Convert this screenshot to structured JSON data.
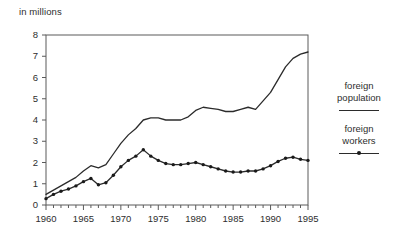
{
  "figure": {
    "unit_label": "in millions"
  },
  "legend": {
    "position": "right",
    "entries": [
      {
        "label": "foreign\npopulation",
        "style": "solid-line",
        "marker": "none"
      },
      {
        "label": "foreign\nworkers",
        "style": "line-with-dot",
        "marker": "dot"
      }
    ]
  },
  "chart_data": {
    "type": "line",
    "title": "",
    "subtitle": "",
    "xlabel": "",
    "ylabel": "in millions",
    "xlim": [
      1960,
      1995
    ],
    "ylim": [
      0,
      8
    ],
    "yticks": [
      0,
      1,
      2,
      3,
      4,
      5,
      6,
      7,
      8
    ],
    "ytick_labels": [
      "0",
      "1",
      "2",
      "3",
      "4",
      "5",
      "6",
      "7",
      "8"
    ],
    "xticks": [
      1960,
      1965,
      1970,
      1975,
      1980,
      1985,
      1990,
      1995
    ],
    "xtick_labels": [
      "1960",
      "1965",
      "1970",
      "1975",
      "1980",
      "1985",
      "1990",
      "1995"
    ],
    "minor_xticks_every": 1,
    "grid": false,
    "legend_position": "right",
    "x": [
      1960,
      1961,
      1962,
      1963,
      1964,
      1965,
      1966,
      1967,
      1968,
      1969,
      1970,
      1971,
      1972,
      1973,
      1974,
      1975,
      1976,
      1977,
      1978,
      1979,
      1980,
      1981,
      1982,
      1983,
      1984,
      1985,
      1986,
      1987,
      1988,
      1989,
      1990,
      1991,
      1992,
      1993,
      1994,
      1995
    ],
    "series": [
      {
        "name": "foreign population",
        "marker": "none",
        "values": [
          0.5,
          0.7,
          0.9,
          1.1,
          1.3,
          1.6,
          1.85,
          1.75,
          1.9,
          2.4,
          2.9,
          3.3,
          3.6,
          4.0,
          4.1,
          4.1,
          4.0,
          4.0,
          4.0,
          4.15,
          4.45,
          4.6,
          4.55,
          4.5,
          4.4,
          4.4,
          4.5,
          4.6,
          4.5,
          4.9,
          5.3,
          5.9,
          6.5,
          6.9,
          7.1,
          7.2
        ]
      },
      {
        "name": "foreign workers",
        "marker": "dot",
        "values": [
          0.3,
          0.5,
          0.65,
          0.75,
          0.9,
          1.1,
          1.25,
          0.95,
          1.05,
          1.4,
          1.8,
          2.1,
          2.3,
          2.6,
          2.3,
          2.1,
          1.95,
          1.9,
          1.9,
          1.95,
          2.0,
          1.9,
          1.8,
          1.7,
          1.6,
          1.55,
          1.55,
          1.6,
          1.6,
          1.7,
          1.85,
          2.05,
          2.2,
          2.25,
          2.15,
          2.1
        ]
      }
    ]
  }
}
